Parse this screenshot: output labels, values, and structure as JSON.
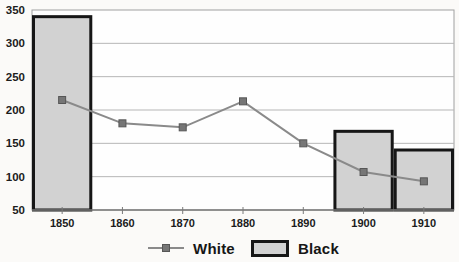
{
  "chart_data": {
    "type": "combo-bar-line",
    "title": "",
    "xlabel": "",
    "ylabel": "",
    "categories": [
      "1850",
      "1860",
      "1870",
      "1880",
      "1890",
      "1900",
      "1910"
    ],
    "series": [
      {
        "name": "White",
        "type": "line",
        "values": [
          215,
          180,
          174,
          213,
          150,
          107,
          93
        ]
      },
      {
        "name": "Black",
        "type": "bar",
        "values": [
          340,
          null,
          null,
          null,
          null,
          168,
          140
        ]
      }
    ],
    "ylim": [
      50,
      350
    ],
    "yticks": [
      50,
      100,
      150,
      200,
      250,
      300,
      350
    ],
    "ytick_labels": [
      "50",
      "100",
      "150",
      "200",
      "250",
      "300",
      "350"
    ],
    "grid": true,
    "legend_position": "bottom-center",
    "colors": {
      "page_bg": "#fbfaf8",
      "plot_bg": "#fefefe",
      "grid": "#b6b6b6",
      "plot_border": "#a0a0a0",
      "axis": "#7a7a7a",
      "bar_fill": "#d2d2d2",
      "bar_border": "#161616",
      "line": "#8a8a8a",
      "marker_fill": "#767676",
      "marker_border": "#565656",
      "text": "#1c1c1c"
    }
  },
  "legend": {
    "white_label": "White",
    "black_label": "Black"
  }
}
